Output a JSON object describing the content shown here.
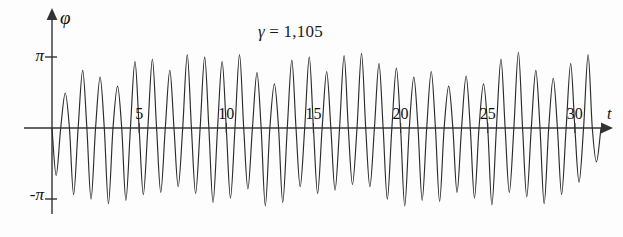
{
  "chart_data": {
    "type": "line",
    "title": "γ = 1,105",
    "title_symbol": "γ",
    "title_rest": " = 1,105",
    "xlabel": "t",
    "ylabel": "φ",
    "xlim": [
      0,
      31.5
    ],
    "ylim": [
      -3.6,
      3.6
    ],
    "grid": false,
    "legend": null,
    "series_name": "phi(t)",
    "line_color": "#2b2b2b",
    "axis_color": "#333333",
    "background": "#fdfdfd",
    "x_ticks": [
      {
        "value": 5,
        "label": "5"
      },
      {
        "value": 10,
        "label": "10"
      },
      {
        "value": 15,
        "label": "15"
      },
      {
        "value": 20,
        "label": "20"
      },
      {
        "value": 25,
        "label": "25"
      },
      {
        "value": 30,
        "label": "30"
      }
    ],
    "y_ticks": [
      {
        "value": 3.14159,
        "label": "π"
      },
      {
        "value": -3.14159,
        "label": "-π"
      }
    ],
    "cycle_period": 1.0,
    "peak_amplitudes": [
      1.55,
      2.55,
      2.25,
      1.85,
      2.95,
      3.05,
      2.55,
      3.25,
      3.15,
      2.95,
      3.25,
      2.45,
      1.95,
      3.0,
      3.15,
      2.5,
      3.2,
      3.3,
      2.85,
      2.65,
      2.25,
      2.5,
      1.85,
      2.3,
      1.95,
      3.05,
      3.35,
      2.55,
      2.2,
      2.85,
      3.25,
      1.7
    ],
    "trough_amplitudes": [
      -2.1,
      -2.95,
      -3.15,
      -3.35,
      -3.2,
      -2.95,
      -2.85,
      -2.6,
      -2.9,
      -3.3,
      -3.1,
      -2.7,
      -3.45,
      -3.3,
      -2.6,
      -2.9,
      -2.75,
      -2.5,
      -2.6,
      -3.15,
      -3.45,
      -3.2,
      -3.25,
      -2.85,
      -3.1,
      -3.4,
      -2.85,
      -3.05,
      -3.35,
      -2.95,
      -2.4,
      -1.5
    ]
  }
}
